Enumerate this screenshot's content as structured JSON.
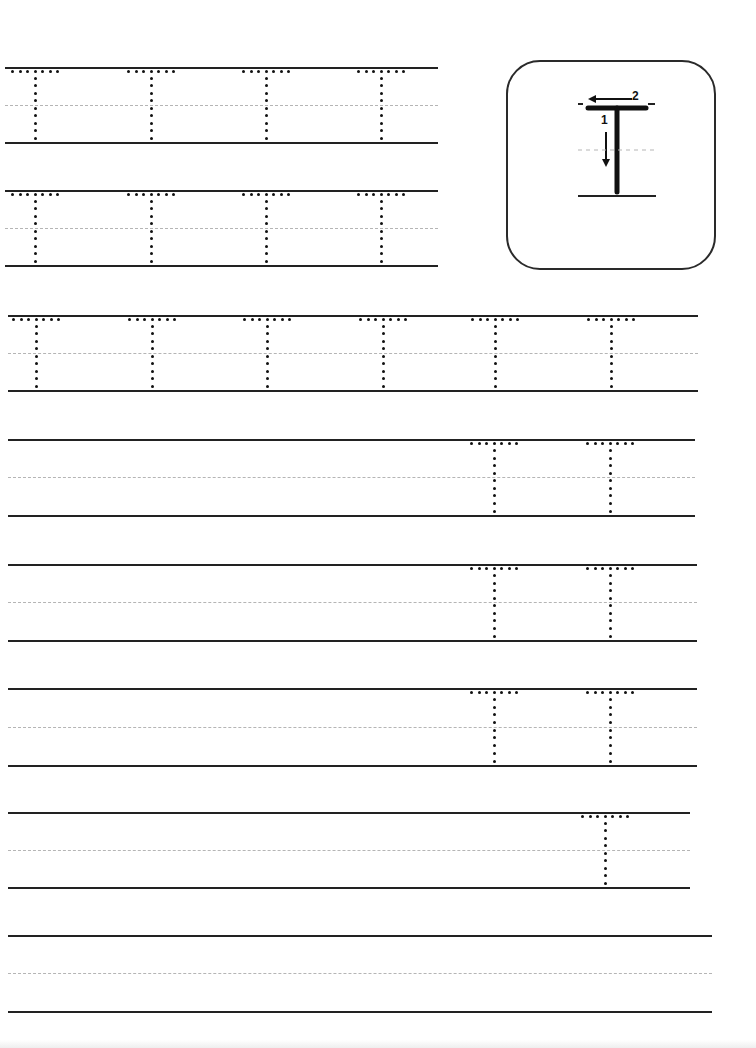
{
  "worksheet": {
    "letter": "T",
    "model": {
      "stroke_1_label": "1",
      "stroke_2_label": "2",
      "stroke_1_direction": "down",
      "stroke_2_direction": "left"
    },
    "rows": [
      {
        "top": 67,
        "bottom": 142,
        "x_start": 5,
        "x_end": 438,
        "traced_letters_x": [
          35,
          151,
          266,
          381
        ]
      },
      {
        "top": 190,
        "bottom": 265,
        "x_start": 5,
        "x_end": 438,
        "traced_letters_x": [
          35,
          151,
          266,
          381
        ]
      },
      {
        "top": 315,
        "bottom": 390,
        "x_start": 8,
        "x_end": 698,
        "traced_letters_x": [
          36,
          152,
          267,
          383,
          495,
          611
        ]
      },
      {
        "top": 439,
        "bottom": 515,
        "x_start": 8,
        "x_end": 695,
        "traced_letters_x": [
          494,
          610
        ]
      },
      {
        "top": 564,
        "bottom": 640,
        "x_start": 8,
        "x_end": 697,
        "traced_letters_x": [
          494,
          610
        ]
      },
      {
        "top": 688,
        "bottom": 765,
        "x_start": 8,
        "x_end": 697,
        "traced_letters_x": [
          494,
          610
        ]
      },
      {
        "top": 812,
        "bottom": 887,
        "x_start": 8,
        "x_end": 690,
        "traced_letters_x": [
          605
        ]
      },
      {
        "top": 935,
        "bottom": 1011,
        "x_start": 8,
        "x_end": 712,
        "traced_letters_x": []
      }
    ]
  },
  "colors": {
    "ink": "#111111",
    "rule": "#222222",
    "midline": "#b5b5b5",
    "paper": "#ffffff"
  }
}
